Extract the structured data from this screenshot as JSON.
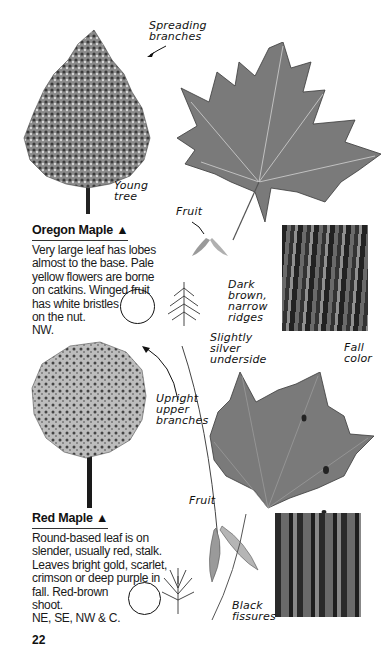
{
  "oregon": {
    "title": "Oregon Maple ▲",
    "lines": [
      "Very large leaf has lobes",
      "almost to the base. Pale",
      "yellow flowers are borne",
      "on catkins. Winged fruit",
      "has white bristles",
      "on the nut.",
      "NW."
    ],
    "labels": {
      "spreading": [
        "Spreading",
        "branches"
      ],
      "young": [
        "Young",
        "tree"
      ],
      "fruit": "Fruit",
      "bark": [
        "Dark",
        "brown,",
        "narrow",
        "ridges"
      ]
    }
  },
  "red": {
    "title": "Red Maple ▲",
    "lines": [
      "Round-based leaf is on",
      "slender, usually red, stalk.",
      "Leaves bright gold, scarlet,",
      "crimson or deep purple in",
      "fall. Red-brown",
      "shoot.",
      "NE, SE, NW & C."
    ],
    "labels": {
      "silver": [
        "Slightly",
        "silver",
        "underside"
      ],
      "fall": [
        "Fall",
        "color"
      ],
      "upright": [
        "Upright",
        "upper",
        "branches"
      ],
      "fruit": "Fruit",
      "bark": [
        "Black",
        "fissures"
      ]
    }
  },
  "page_number": "22",
  "colors": {
    "ink": "#111111",
    "leaf": "#7a7a7a",
    "bark": "#2e2e2e"
  }
}
